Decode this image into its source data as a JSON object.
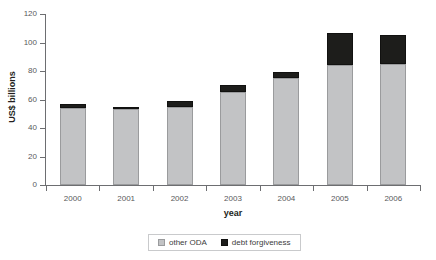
{
  "chart_data": {
    "type": "bar",
    "stacked": true,
    "title": "",
    "xlabel": "year",
    "ylabel": "US$ billions",
    "categories": [
      "2000",
      "2001",
      "2002",
      "2003",
      "2004",
      "2005",
      "2006"
    ],
    "series": [
      {
        "name": "other ODA",
        "color": "#c2c3c5",
        "values": [
          54,
          53,
          55,
          65,
          75,
          84,
          85
        ]
      },
      {
        "name": "debt forgiveness",
        "color": "#1d1d1b",
        "values": [
          3,
          2,
          4,
          5,
          4,
          23,
          20
        ]
      }
    ],
    "totals": [
      57,
      55,
      59,
      70,
      79,
      107,
      105
    ],
    "ylim": [
      0,
      120
    ],
    "yticks": [
      0,
      20,
      40,
      60,
      80,
      100,
      120
    ],
    "ytick_labels": [
      "0",
      "20",
      "40",
      "60",
      "80",
      "100",
      "120"
    ],
    "grid": false,
    "legend_position": "bottom"
  },
  "legend": {
    "items": [
      {
        "label": "other ODA",
        "swatch": "oda"
      },
      {
        "label": "debt forgiveness",
        "swatch": "debt"
      }
    ]
  }
}
